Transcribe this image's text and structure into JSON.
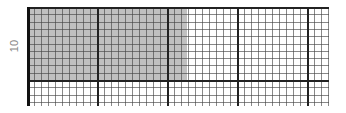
{
  "chart_data": {
    "type": "heatmap",
    "title": "",
    "xlabel": "",
    "ylabel": "10",
    "grid": {
      "major_x_spacing_px": 70,
      "minor_x_spacing_px": 7,
      "major_y_spacing_px": 73,
      "minor_y_spacing_px": 7.3,
      "major_color": "#222222",
      "minor_color": "#444444"
    },
    "shaded_region": {
      "x_from_px": 0,
      "x_to_px": 160,
      "y_from_px": 0,
      "y_to_px": 73,
      "color": "#c0c0c0"
    },
    "plot_area": {
      "width": 305,
      "height": 99
    },
    "y_tick_labels": [
      "10"
    ]
  }
}
